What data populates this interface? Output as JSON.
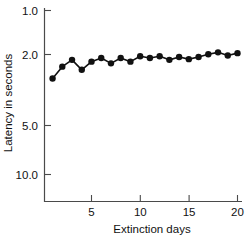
{
  "chart_data": {
    "type": "line",
    "title": "",
    "xlabel": "Extinction days",
    "ylabel": "Latency in seconds",
    "x": [
      1,
      2,
      3,
      4,
      5,
      6,
      7,
      8,
      9,
      10,
      11,
      12,
      13,
      14,
      15,
      16,
      17,
      18,
      19,
      20
    ],
    "values": [
      2.6,
      2.2,
      2.0,
      2.3,
      2.05,
      1.95,
      2.1,
      1.95,
      2.05,
      1.9,
      1.95,
      1.9,
      2.0,
      1.92,
      1.98,
      1.92,
      1.85,
      1.8,
      1.88,
      1.82
    ],
    "series": [
      {
        "name": "Latency",
        "values": [
          2.6,
          2.2,
          2.0,
          2.3,
          2.05,
          1.95,
          2.1,
          1.95,
          2.05,
          1.9,
          1.95,
          1.9,
          2.0,
          1.92,
          1.98,
          1.92,
          1.85,
          1.8,
          1.88,
          1.82
        ]
      }
    ],
    "xticks": [
      5,
      10,
      15,
      20
    ],
    "xtick_labels": [
      "5",
      "10",
      "15",
      "20"
    ],
    "yticks": [
      1.0,
      2.0,
      5.0,
      10.0
    ],
    "ytick_labels": [
      "1.0",
      "2.0",
      "5.0",
      "10.0"
    ],
    "xlim": [
      0.4,
      20.6
    ],
    "ylim": [
      1.0,
      10.0
    ],
    "y_scale": "log",
    "y_inverted": true,
    "grid": false,
    "legend": "none",
    "marker": "filled-circle",
    "line_color": "#111111",
    "marker_color": "#111111",
    "axis_color": "#4a4a4a",
    "background": "#ffffff"
  },
  "axes": {
    "x_title": "Extinction days",
    "y_title": "Latency in seconds",
    "x_tick_labels": [
      "5",
      "10",
      "15",
      "20"
    ],
    "y_tick_labels": [
      "1.0",
      "2.0",
      "5.0",
      "10.0"
    ]
  }
}
